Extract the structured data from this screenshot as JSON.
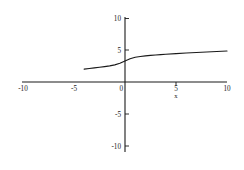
{
  "chart_data": {
    "type": "line",
    "title": "",
    "xlabel": "x",
    "ylabel": "",
    "xlim": [
      -10,
      10
    ],
    "ylim": [
      -10,
      10
    ],
    "grid": false,
    "legend": null,
    "x_ticks": [
      -10,
      -5,
      5,
      10
    ],
    "x_tick_labels": [
      "-10",
      "-5",
      "5",
      "10"
    ],
    "y_ticks": [
      10,
      5,
      0,
      -5,
      -10
    ],
    "y_tick_labels": [
      "10",
      "5",
      "0",
      "-5",
      "-10"
    ],
    "series": [
      {
        "name": "curve",
        "color": "#1a1a1a",
        "x": [
          -4.0,
          -3.5,
          -3.0,
          -2.5,
          -2.0,
          -1.5,
          -1.0,
          -0.5,
          0.0,
          0.5,
          1.0,
          1.5,
          2.0,
          2.5,
          3.0,
          3.5,
          4.0,
          5.0,
          6.0,
          7.0,
          8.0,
          9.0,
          10.0
        ],
        "values": [
          2.03,
          2.13,
          2.22,
          2.32,
          2.43,
          2.55,
          2.7,
          2.95,
          3.3,
          3.66,
          3.9,
          4.02,
          4.11,
          4.19,
          4.25,
          4.31,
          4.37,
          4.47,
          4.56,
          4.65,
          4.73,
          4.8,
          4.88
        ]
      }
    ]
  },
  "axes": {
    "x_axis_name": "x-axis",
    "y_axis_name": "y-axis"
  },
  "colors": {
    "ink": "#1a1a1a",
    "background": "#ffffff",
    "label": "#222222"
  }
}
